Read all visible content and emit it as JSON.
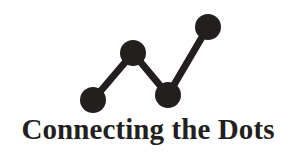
{
  "logo": {
    "wordmark": "Connecting the Dots",
    "mark_name": "connecting-dots-line-chart-mark",
    "colors": {
      "ink": "#231f1e",
      "background": "#ffffff"
    },
    "mark_geometry": {
      "stroke_width": 7,
      "node_radius": 13,
      "nodes": [
        {
          "label": "node-1",
          "x": 93,
          "y": 100
        },
        {
          "label": "node-2",
          "x": 133,
          "y": 53
        },
        {
          "label": "node-3",
          "x": 168,
          "y": 95
        },
        {
          "label": "node-4",
          "x": 208,
          "y": 27
        }
      ]
    }
  }
}
